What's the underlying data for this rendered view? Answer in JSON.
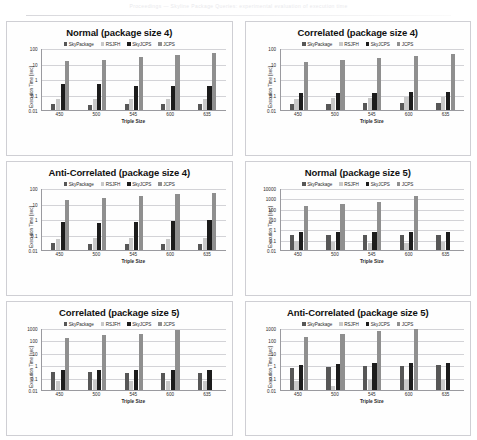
{
  "page": {
    "scan_header_text": "Proceedings — Skyline Package Queries: experimental evaluation of execution time"
  },
  "series_colors": {
    "SkyPackage": "#575757",
    "RSJFH": "#c9c9c9",
    "SkyJCPS": "#1c1c1c",
    "JCPS": "#8f8f8f"
  },
  "common": {
    "xlabel": "Triple Size",
    "ylabel": "Execution Time [sec]",
    "categories": [
      "450",
      "500",
      "545",
      "600",
      "635"
    ],
    "legend": [
      "SkyPackage",
      "RSJFH",
      "SkyJCPS",
      "JCPS"
    ]
  },
  "chart_data": [
    {
      "type": "bar",
      "title": "Normal (package size 4)",
      "xlabel": "Triple Size",
      "ylabel": "Execution Time [sec]",
      "yscale": "log",
      "ylim": [
        0.01,
        100
      ],
      "yticks": [
        "0.01",
        "0.1",
        "1",
        "10",
        "100"
      ],
      "grid": true,
      "legend_position": "top-center",
      "categories": [
        "450",
        "500",
        "545",
        "600",
        "635"
      ],
      "series": [
        {
          "name": "SkyPackage",
          "values": [
            0.025,
            0.022,
            0.024,
            0.026,
            0.023
          ]
        },
        {
          "name": "RSJFH",
          "values": [
            0.048,
            0.055,
            0.053,
            0.05,
            0.05
          ]
        },
        {
          "name": "SkyJCPS",
          "values": [
            0.5,
            0.48,
            0.36,
            0.38,
            0.33
          ]
        },
        {
          "name": "JCPS",
          "values": [
            14,
            18,
            25,
            33,
            45
          ]
        }
      ]
    },
    {
      "type": "bar",
      "title": "Correlated (package size 4)",
      "xlabel": "Triple Size",
      "ylabel": "Execution Time [sec]",
      "yscale": "log",
      "ylim": [
        0.01,
        100
      ],
      "yticks": [
        "0.01",
        "0.1",
        "1",
        "10",
        "100"
      ],
      "grid": true,
      "legend_position": "top-center",
      "categories": [
        "450",
        "500",
        "545",
        "600",
        "635"
      ],
      "series": [
        {
          "name": "SkyPackage",
          "values": [
            0.024,
            0.026,
            0.027,
            0.028,
            0.029
          ]
        },
        {
          "name": "RSJFH",
          "values": [
            0.05,
            0.062,
            0.063,
            0.065,
            0.068
          ]
        },
        {
          "name": "SkyJCPS",
          "values": [
            0.12,
            0.125,
            0.13,
            0.135,
            0.145
          ]
        },
        {
          "name": "JCPS",
          "values": [
            12,
            17,
            24,
            30,
            40
          ]
        }
      ]
    },
    {
      "type": "bar",
      "title": "Anti-Correlated (package size 4)",
      "xlabel": "Triple Size",
      "ylabel": "Execution Time [sec]",
      "yscale": "log",
      "ylim": [
        0.01,
        100
      ],
      "yticks": [
        "0.01",
        "0.1",
        "1",
        "10",
        "100"
      ],
      "grid": true,
      "legend_position": "top-center",
      "categories": [
        "450",
        "500",
        "545",
        "600",
        "635"
      ],
      "series": [
        {
          "name": "SkyPackage",
          "values": [
            0.027,
            0.024,
            0.025,
            0.026,
            0.024
          ]
        },
        {
          "name": "RSJFH",
          "values": [
            0.055,
            0.06,
            0.057,
            0.05,
            0.057
          ]
        },
        {
          "name": "SkyJCPS",
          "values": [
            0.62,
            0.52,
            0.6,
            0.8,
            0.82
          ]
        },
        {
          "name": "JCPS",
          "values": [
            18,
            23,
            30,
            42,
            50
          ]
        }
      ]
    },
    {
      "type": "bar",
      "title": "Normal (package size 5)",
      "xlabel": "Triple Size",
      "ylabel": "Execution Time [sec]",
      "yscale": "log",
      "ylim": [
        0.01,
        10000
      ],
      "yticks": [
        "0.01",
        "0.1",
        "1",
        "10",
        "100",
        "1000",
        "10000"
      ],
      "grid": true,
      "legend_position": "top-center",
      "categories": [
        "450",
        "500",
        "545",
        "600",
        "635"
      ],
      "series": [
        {
          "name": "SkyPackage",
          "values": [
            0.3,
            0.3,
            0.3,
            0.3,
            0.3
          ]
        },
        {
          "name": "RSJFH",
          "values": [
            0.07,
            0.055,
            0.05,
            0.05,
            0.055
          ]
        },
        {
          "name": "SkyJCPS",
          "values": [
            0.5,
            0.5,
            0.6,
            0.6,
            0.55
          ]
        },
        {
          "name": "JCPS",
          "values": [
            170,
            300,
            400,
            1700,
            null
          ]
        }
      ]
    },
    {
      "type": "bar",
      "title": "Correlated (package size 5)",
      "xlabel": "Triple Size",
      "ylabel": "Execution Time [sec]",
      "yscale": "log",
      "ylim": [
        0.01,
        1000
      ],
      "yticks": [
        "0.01",
        "0.1",
        "1",
        "10",
        "100",
        "1000"
      ],
      "grid": true,
      "legend_position": "top-center",
      "categories": [
        "450",
        "500",
        "545",
        "600",
        "635"
      ],
      "series": [
        {
          "name": "SkyPackage",
          "values": [
            0.26,
            0.26,
            0.24,
            0.23,
            0.22
          ]
        },
        {
          "name": "RSJFH",
          "values": [
            0.055,
            0.062,
            0.058,
            0.055,
            0.058
          ]
        },
        {
          "name": "SkyJCPS",
          "values": [
            0.45,
            0.42,
            0.42,
            0.42,
            0.4
          ]
        },
        {
          "name": "JCPS",
          "values": [
            150,
            250,
            350,
            700,
            null
          ]
        }
      ]
    },
    {
      "type": "bar",
      "title": "Anti-Correlated (package size 5)",
      "xlabel": "Triple Size",
      "ylabel": "Execution Time [sec]",
      "yscale": "log",
      "ylim": [
        0.01,
        1000
      ],
      "yticks": [
        "0.01",
        "0.1",
        "1",
        "10",
        "100",
        "1000"
      ],
      "grid": true,
      "legend_position": "top-center",
      "categories": [
        "450",
        "500",
        "545",
        "600",
        "635"
      ],
      "series": [
        {
          "name": "SkyPackage",
          "values": [
            0.6,
            0.75,
            0.9,
            0.9,
            1.05
          ]
        },
        {
          "name": "RSJFH",
          "values": [
            0.055,
            0.02,
            0.065,
            0.06,
            0.06
          ]
        },
        {
          "name": "SkyJCPS",
          "values": [
            1.0,
            1.15,
            1.4,
            1.4,
            1.4
          ]
        },
        {
          "name": "JCPS",
          "values": [
            200,
            350,
            550,
            800,
            null
          ]
        }
      ]
    }
  ]
}
